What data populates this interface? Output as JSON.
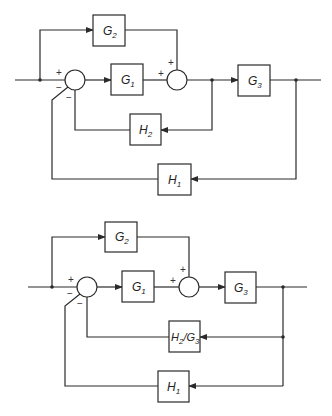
{
  "diagrams": [
    {
      "id": "original",
      "blocks": {
        "g2": {
          "name": "G",
          "sub": "2"
        },
        "g1": {
          "name": "G",
          "sub": "1"
        },
        "g3": {
          "name": "G",
          "sub": "3"
        },
        "h2": {
          "name": "H",
          "sub": "2"
        },
        "h1": {
          "name": "H",
          "sub": "1"
        }
      },
      "signs": {
        "sum1_plus": "+",
        "sum1_minus_outer": "−",
        "sum1_minus_inner": "−",
        "sum2_plus_left": "+",
        "sum2_plus_top": "+"
      }
    },
    {
      "id": "rearranged",
      "blocks": {
        "g2": {
          "name": "G",
          "sub": "2"
        },
        "g1": {
          "name": "G",
          "sub": "1"
        },
        "g3": {
          "name": "G",
          "sub": "3"
        },
        "h2g3": {
          "name": "H",
          "sub": "2",
          "slash": "/G",
          "sub2": "3"
        },
        "h1": {
          "name": "H",
          "sub": "1"
        }
      },
      "signs": {
        "sum1_plus": "+",
        "sum1_minus_outer": "−",
        "sum1_minus_inner": "−",
        "sum2_plus_left": "+",
        "sum2_plus_top": "+"
      }
    }
  ]
}
